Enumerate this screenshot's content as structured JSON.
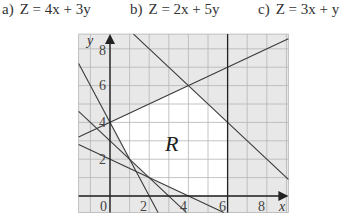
{
  "expressions": [
    {
      "label": "a)",
      "text": "Z = 4x + 3y",
      "left": 2
    },
    {
      "label": "b)",
      "text": "Z = 2x + 5y",
      "left": 130
    },
    {
      "label": "c)",
      "text": "Z = 3x + y",
      "left": 258
    }
  ],
  "graph": {
    "x_axis_label": "x",
    "y_axis_label": "y",
    "x_tick_labels": [
      "0",
      "2",
      "4",
      "6",
      "8"
    ],
    "y_tick_labels": [
      "2",
      "4",
      "6",
      "8"
    ],
    "region_label": "R",
    "x_range": [
      -1.6,
      9.1
    ],
    "y_range": [
      -0.9,
      8.8
    ],
    "grid_step": 1,
    "colors": {
      "shaded": "#e8e8e8",
      "unshaded": "#ffffff",
      "grid": "#b5b5b5",
      "lines": "#3a3a3a",
      "axes": "#222222"
    },
    "boundary_lines": [
      {
        "equation": "x + y = 10"
      },
      {
        "equation": "y = 4 + x/2"
      },
      {
        "equation": "x = 6"
      },
      {
        "equation": "2x + y = 4"
      },
      {
        "equation": "x + y = 3"
      },
      {
        "equation": "x + 2y = 4"
      }
    ],
    "region_vertices": [
      [
        0,
        4
      ],
      [
        4,
        6
      ],
      [
        6,
        4
      ],
      [
        6,
        0
      ],
      [
        4,
        0
      ],
      [
        2,
        1
      ],
      [
        1,
        2
      ]
    ]
  }
}
